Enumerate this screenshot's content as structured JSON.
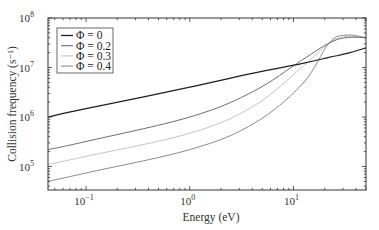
{
  "chart_data": {
    "type": "line",
    "title": "",
    "xlabel": "Energy (eV)",
    "ylabel": "Collision frequency (s⁻¹)",
    "xscale": "log",
    "yscale": "log",
    "xlim": [
      0.043,
      50
    ],
    "ylim": [
      30000,
      100000000
    ],
    "x_ticks": [
      {
        "value": 0.1,
        "base": "10",
        "exp": "−1"
      },
      {
        "value": 1,
        "base": "10",
        "exp": "0"
      },
      {
        "value": 10,
        "base": "10",
        "exp": "1"
      }
    ],
    "y_ticks": [
      {
        "value": 100000,
        "base": "10",
        "exp": "5"
      },
      {
        "value": 1000000,
        "base": "10",
        "exp": "6"
      },
      {
        "value": 10000000,
        "base": "10",
        "exp": "7"
      },
      {
        "value": 100000000,
        "base": "10",
        "exp": "8"
      }
    ],
    "grid": false,
    "legend_position": "upper left",
    "series": [
      {
        "name": "Φ = 0",
        "color": "#1e1e1e",
        "x": [
          0.043,
          0.1,
          1,
          4,
          12,
          22,
          32,
          50
        ],
        "y": [
          1000000,
          1470000,
          4000000,
          7600000,
          12000000,
          16000000,
          19000000,
          25000000
        ]
      },
      {
        "name": "Φ = 0.2",
        "color": "#6e6e6e",
        "x": [
          0.043,
          0.1,
          1,
          4,
          12,
          22,
          32,
          50
        ],
        "y": [
          220000,
          320000,
          1000000,
          3200000,
          14000000,
          31000000,
          40000000,
          40000000
        ]
      },
      {
        "name": "Φ = 0.3",
        "color": "#c4c4c4",
        "x": [
          0.043,
          0.1,
          1,
          4,
          12,
          22,
          32,
          50
        ],
        "y": [
          110000,
          160000,
          470000,
          1600000,
          10000000,
          31000000,
          42000000,
          40000000
        ]
      },
      {
        "name": "Φ = 0.4",
        "color": "#8a8a8a",
        "x": [
          0.043,
          0.1,
          1,
          4,
          12,
          22,
          32,
          50
        ],
        "y": [
          50000,
          74000,
          220000,
          710000,
          4500000,
          31000000,
          45000000,
          40000000
        ]
      }
    ]
  }
}
